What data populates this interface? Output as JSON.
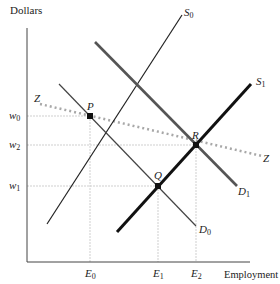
{
  "axes": {
    "y_label": "Dollars",
    "x_label": "Employment"
  },
  "wage_ticks": [
    {
      "sym": "w",
      "sub": "0"
    },
    {
      "sym": "w",
      "sub": "2"
    },
    {
      "sym": "w",
      "sub": "1"
    }
  ],
  "employment_ticks": [
    {
      "sym": "E",
      "sub": "0"
    },
    {
      "sym": "E",
      "sub": "1"
    },
    {
      "sym": "E",
      "sub": "2"
    }
  ],
  "curves": {
    "S0": {
      "sym": "S",
      "sub": "0"
    },
    "S1": {
      "sym": "S",
      "sub": "1"
    },
    "D0": {
      "sym": "D",
      "sub": "0"
    },
    "D1": {
      "sym": "D",
      "sub": "1"
    },
    "Z_left": "Z",
    "Z_right": "Z"
  },
  "points": {
    "P": "P",
    "Q": "Q",
    "R": "R"
  },
  "colors": {
    "axis": "#444444",
    "guide": "#cccccc",
    "s0": "#222222",
    "d0": "#444444",
    "d1": "#555555",
    "s1": "#111111",
    "z": "#aaaaaa",
    "point": "#111111"
  }
}
